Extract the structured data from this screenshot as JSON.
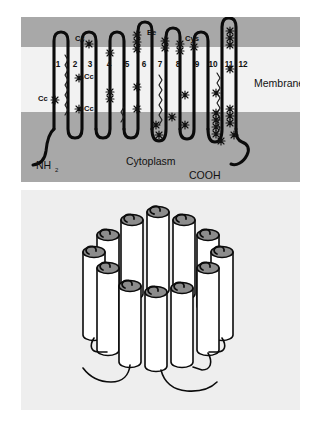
{
  "figure": {
    "background_color": "#ffffff"
  },
  "top_panel": {
    "name": "topology-diagram",
    "bands": {
      "outer_top_color": "#a8a8a8",
      "membrane_color": "#f2f2f2",
      "cytoplasm_color": "#a8a8a8"
    },
    "labels": {
      "membrane": "Membrane",
      "cytoplasm": "Cytoplasm",
      "n_terminus": "NH",
      "n_terminus_sub": "2",
      "c_terminus": "COOH"
    },
    "helix_numbers": [
      "1",
      "2",
      "3",
      "4",
      "5",
      "6",
      "7",
      "8",
      "9",
      "10",
      "11",
      "12"
    ],
    "site_labels": [
      {
        "text": "Cc",
        "x": 17,
        "y": 81
      },
      {
        "text": "Cc",
        "x": 51,
        "y": 58
      },
      {
        "text": "Cc",
        "x": 54,
        "y": 88
      },
      {
        "text": "Cc",
        "x": 54,
        "y": 23
      },
      {
        "text": "Ee",
        "x": 129,
        "y": 17
      },
      {
        "text": "Cys",
        "x": 167,
        "y": 24
      }
    ]
  },
  "bottom_panel": {
    "name": "helical-barrel-model",
    "background_color": "#eeeeee",
    "cylinder_count": 12,
    "cylinder_top_color": "#8c8c8c",
    "cylinder_body_color": "#ffffff",
    "outline_color": "#0b0b0b"
  }
}
